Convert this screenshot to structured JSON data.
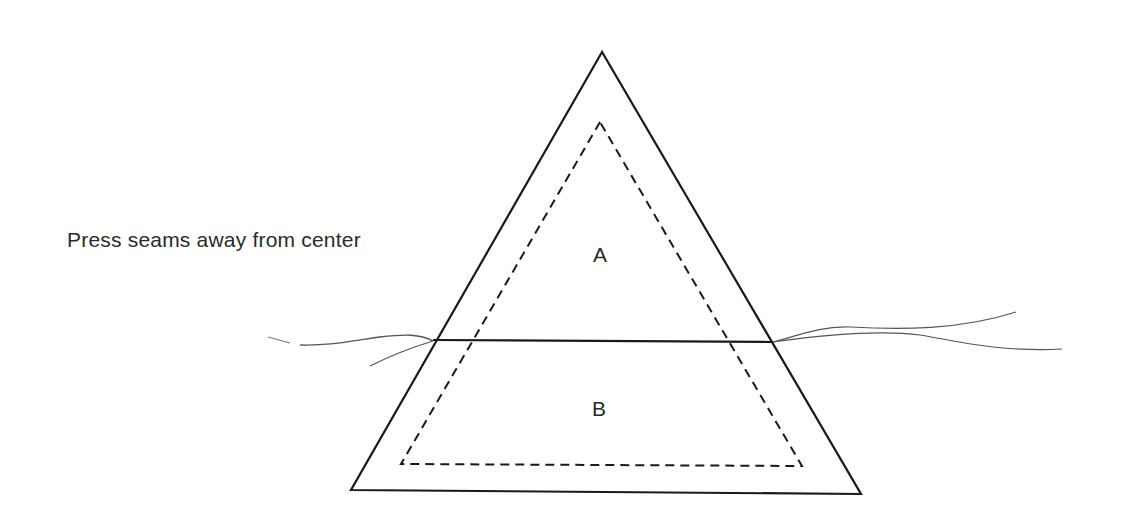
{
  "diagram": {
    "caption": "Press seams away from center",
    "pieces": [
      {
        "label": "A",
        "position": "upper triangle"
      },
      {
        "label": "B",
        "position": "lower trapezoid"
      }
    ],
    "colors": {
      "line": "#1a1a1a",
      "thread": "#555555",
      "text": "#2a2a2a",
      "background": "#ffffff"
    }
  }
}
